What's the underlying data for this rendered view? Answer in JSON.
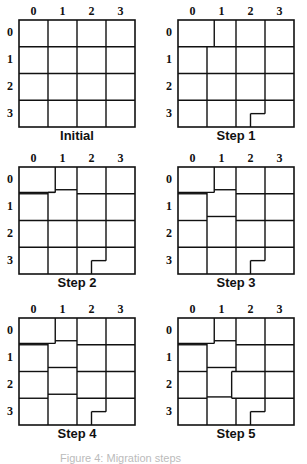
{
  "figure": {
    "col_labels": [
      "0",
      "1",
      "2",
      "3"
    ],
    "row_labels": [
      "0",
      "1",
      "2",
      "3"
    ],
    "grid_size": 4,
    "line_color": "#111111",
    "panels": [
      {
        "caption": "Initial",
        "segments": {
          "vertical": [
            [
              1,
              0,
              1,
              4
            ],
            [
              2,
              0,
              2,
              4
            ],
            [
              3,
              0,
              3,
              4
            ]
          ],
          "horizontal": [
            [
              0,
              1,
              4,
              1
            ],
            [
              0,
              2,
              4,
              2
            ],
            [
              0,
              3,
              4,
              3
            ]
          ]
        }
      },
      {
        "caption": "Step 1",
        "segments": {
          "vertical": [
            [
              1.25,
              0,
              1.25,
              1
            ],
            [
              1,
              1,
              1,
              4
            ],
            [
              2,
              0,
              2,
              4
            ],
            [
              3,
              0,
              3,
              3.5
            ],
            [
              2.5,
              3.5,
              2.5,
              4
            ]
          ],
          "horizontal": [
            [
              0,
              1,
              4,
              1
            ],
            [
              0,
              2,
              4,
              2
            ],
            [
              0,
              3,
              4,
              3
            ],
            [
              2.5,
              3.5,
              3,
              3.5
            ]
          ]
        }
      },
      {
        "caption": "Step 2",
        "segments": {
          "vertical": [
            [
              1.25,
              0,
              1.25,
              0.95
            ],
            [
              1,
              0.95,
              1,
              4
            ],
            [
              2,
              0,
              2,
              4
            ],
            [
              3,
              0,
              3,
              3.5
            ],
            [
              2.5,
              3.5,
              2.5,
              4
            ]
          ],
          "horizontal": [
            [
              0,
              0.95,
              1.25,
              0.95
            ],
            [
              1,
              0.95,
              1,
              0.95
            ],
            [
              1,
              0.95,
              1.25,
              0.95
            ],
            [
              1.25,
              0.85,
              2,
              0.85
            ],
            [
              2,
              1,
              4,
              1
            ],
            [
              0,
              1,
              1,
              1
            ],
            [
              0,
              2,
              4,
              2
            ],
            [
              0,
              3,
              4,
              3
            ],
            [
              2.5,
              3.5,
              3,
              3.5
            ]
          ]
        }
      },
      {
        "caption": "Step 3",
        "segments": {
          "vertical": [
            [
              1.25,
              0,
              1.25,
              0.95
            ],
            [
              1,
              0.95,
              1,
              4
            ],
            [
              2,
              0,
              2,
              4
            ],
            [
              3,
              0,
              3,
              3.5
            ],
            [
              2.5,
              3.5,
              2.5,
              4
            ]
          ],
          "horizontal": [
            [
              0,
              0.95,
              1.25,
              0.95
            ],
            [
              1.25,
              0.85,
              2,
              0.85
            ],
            [
              2,
              1,
              4,
              1
            ],
            [
              0,
              1,
              1,
              1
            ],
            [
              0,
              2,
              1,
              2
            ],
            [
              1,
              1.85,
              2,
              1.85
            ],
            [
              2,
              2,
              4,
              2
            ],
            [
              0,
              3,
              4,
              3
            ],
            [
              2.5,
              3.5,
              3,
              3.5
            ]
          ]
        }
      },
      {
        "caption": "Step 4",
        "segments": {
          "vertical": [
            [
              1.25,
              0,
              1.25,
              0.95
            ],
            [
              1,
              0.95,
              1,
              4
            ],
            [
              2,
              0,
              2,
              4
            ],
            [
              3,
              0,
              3,
              3.5
            ],
            [
              2.5,
              3.5,
              2.5,
              4
            ]
          ],
          "horizontal": [
            [
              0,
              0.95,
              1.25,
              0.95
            ],
            [
              1.25,
              0.85,
              2,
              0.85
            ],
            [
              2,
              1,
              4,
              1
            ],
            [
              0,
              1,
              1,
              1
            ],
            [
              0,
              2,
              1,
              2
            ],
            [
              1,
              1.85,
              2,
              1.85
            ],
            [
              2,
              2,
              4,
              2
            ],
            [
              0,
              3,
              1,
              3
            ],
            [
              1,
              2.85,
              2,
              2.85
            ],
            [
              2,
              3,
              4,
              3
            ],
            [
              2.5,
              3.5,
              3,
              3.5
            ]
          ]
        }
      },
      {
        "caption": "Step 5",
        "segments": {
          "vertical": [
            [
              1.25,
              0,
              1.25,
              0.95
            ],
            [
              1,
              0.95,
              1,
              4
            ],
            [
              2,
              0,
              2,
              2
            ],
            [
              1.85,
              2,
              1.85,
              3
            ],
            [
              2,
              3,
              2,
              4
            ],
            [
              3,
              0,
              3,
              3.5
            ],
            [
              2.5,
              3.5,
              2.5,
              4
            ]
          ],
          "horizontal": [
            [
              0,
              0.95,
              1.25,
              0.95
            ],
            [
              1.25,
              0.85,
              2,
              0.85
            ],
            [
              2,
              1,
              4,
              1
            ],
            [
              0,
              1,
              1,
              1
            ],
            [
              0,
              2,
              1,
              2
            ],
            [
              1,
              1.85,
              2,
              1.85
            ],
            [
              1.85,
              2,
              4,
              2
            ],
            [
              0,
              3,
              1,
              3
            ],
            [
              1,
              2.95,
              1.85,
              2.95
            ],
            [
              1.85,
              3,
              4,
              3
            ],
            [
              2.5,
              3.5,
              3,
              3.5
            ]
          ]
        }
      }
    ],
    "partial_caption": "Figure 4: Migration steps"
  }
}
